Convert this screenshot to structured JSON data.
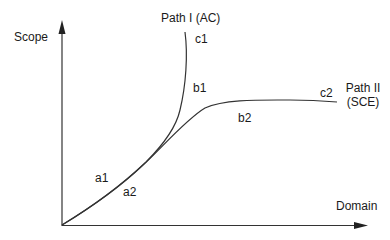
{
  "diagram": {
    "axes": {
      "y_label": "Scope",
      "x_label": "Domain"
    },
    "paths": [
      {
        "name": "Path I",
        "qualifier": "(AC)",
        "label": "Path I (AC)",
        "points": [
          "a1",
          "b1",
          "c1"
        ]
      },
      {
        "name": "Path II",
        "qualifier": "(SCE)",
        "label_line1": "Path II",
        "label_line2": "(SCE)",
        "points": [
          "a2",
          "b2",
          "c2"
        ]
      }
    ],
    "point_labels": {
      "a1": "a1",
      "a2": "a2",
      "b1": "b1",
      "b2": "b2",
      "c1": "c1",
      "c2": "c2"
    },
    "colors": {
      "line": "#333333",
      "text": "#1a1a1a"
    }
  }
}
